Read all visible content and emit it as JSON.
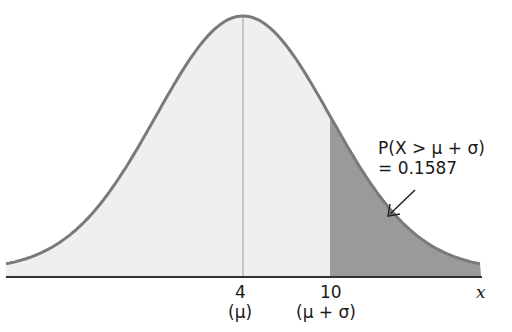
{
  "chart_data": {
    "type": "area",
    "title": "",
    "xlabel": "x",
    "ylabel": "",
    "distribution": "normal",
    "mu": 4,
    "sigma": 6,
    "x_ticks": [
      {
        "value": 4,
        "label": "4",
        "sublabel": "(μ)"
      },
      {
        "value": 10,
        "label": "10",
        "sublabel": "(μ + σ)"
      }
    ],
    "shaded_region": {
      "from": 10,
      "to": "inf",
      "probability": 0.1587
    },
    "annotation": {
      "line1": "P(X > μ + σ)",
      "line2": "= 0.1587"
    },
    "colors": {
      "curve": "#7a7a7a",
      "fill_light": "#efefef",
      "fill_dark": "#9a9a9a",
      "axis": "#333333"
    }
  },
  "labels": {
    "tick_mu": "4",
    "tick_mu_sub": "(μ)",
    "tick_sigma": "10",
    "tick_sigma_sub": "(μ + σ)",
    "x_axis": "x",
    "prob_line1": "P(X > μ + σ)",
    "prob_line2": "= 0.1587"
  }
}
